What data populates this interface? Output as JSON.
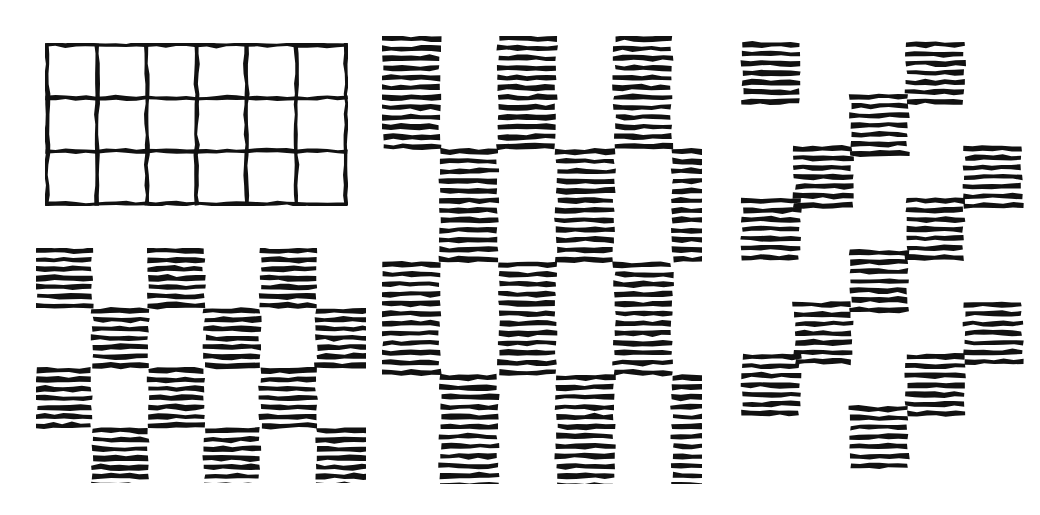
{
  "figure": {
    "background_color": "#ffffff",
    "ink_color": "#111111",
    "style": "hand-drawn ink sketch",
    "canvas": {
      "width": 1040,
      "height": 515
    }
  },
  "panels": [
    {
      "id": "grid",
      "name": "plain-grid-panel",
      "description": "Hand-drawn rectangular lattice of empty cells",
      "position": {
        "x": 45,
        "y": 43,
        "width": 303,
        "height": 163
      },
      "columns": 6,
      "rows": 3,
      "cell_width": 50.5,
      "cell_height": 54.3,
      "stroke_width": 4,
      "filled": false
    },
    {
      "id": "brick-lower-left",
      "name": "brick-pattern-panel-lower-left",
      "description": "Checkerboard of short horizontally hatched blocks, rows offset by half a block",
      "position": {
        "x": 36,
        "y": 248,
        "width": 330,
        "height": 235
      },
      "block_width": 56,
      "block_height": 60,
      "hatch_lines_per_block": 7,
      "hatch_spacing": 9,
      "hatch_thickness": 5,
      "row_offsets": [
        0,
        56,
        0,
        56
      ],
      "blocks_per_row": [
        3,
        3,
        3,
        3
      ],
      "column_pitch": 112,
      "row_pitch": 60
    },
    {
      "id": "brick-tall",
      "name": "brick-pattern-panel-center",
      "description": "Checkerboard of tall horizontally hatched blocks, rows offset by half a block",
      "position": {
        "x": 382,
        "y": 36,
        "width": 320,
        "height": 448
      },
      "block_width": 58,
      "block_height": 113,
      "hatch_lines_per_block": 12,
      "hatch_spacing": 9.8,
      "hatch_thickness": 5,
      "row_offsets": [
        0,
        58,
        0,
        58
      ],
      "blocks_per_row": [
        3,
        3,
        3,
        3
      ],
      "column_pitch": 116,
      "row_pitch": 113
    },
    {
      "id": "stagger",
      "name": "staggered-pattern-panel-right",
      "description": "Sparse diagonally staggered horizontally hatched blocks forming a zigzag lattice",
      "position": {
        "x": 736,
        "y": 36,
        "width": 290,
        "height": 448
      },
      "block_width": 58,
      "block_height": 62,
      "hatch_lines_per_block": 7,
      "hatch_spacing": 9.5,
      "hatch_thickness": 5,
      "block_positions": [
        {
          "x": 6,
          "y": 6
        },
        {
          "x": 170,
          "y": 6
        },
        {
          "x": 114,
          "y": 58
        },
        {
          "x": 58,
          "y": 110
        },
        {
          "x": 228,
          "y": 110
        },
        {
          "x": 6,
          "y": 162
        },
        {
          "x": 170,
          "y": 162
        },
        {
          "x": 114,
          "y": 214
        },
        {
          "x": 58,
          "y": 266
        },
        {
          "x": 228,
          "y": 266
        },
        {
          "x": 6,
          "y": 318
        },
        {
          "x": 170,
          "y": 318
        },
        {
          "x": 114,
          "y": 370
        }
      ]
    }
  ],
  "chart_data": {
    "type": "diagram",
    "subplots": [
      {
        "label": "plain grid",
        "type": "lattice",
        "columns": 6,
        "rows": 3,
        "fill": "none"
      },
      {
        "label": "brick pattern, short blocks",
        "type": "offset-block-grid",
        "rows": 4,
        "blocks_per_row": 3,
        "fill": "horizontal-hatch",
        "lines_per_block": 7
      },
      {
        "label": "brick pattern, tall blocks",
        "type": "offset-block-grid",
        "rows": 4,
        "blocks_per_row": 3,
        "fill": "horizontal-hatch",
        "lines_per_block": 12
      },
      {
        "label": "staggered diagonal pattern",
        "type": "staggered-block-lattice",
        "block_count": 13,
        "fill": "horizontal-hatch",
        "lines_per_block": 7
      }
    ]
  }
}
